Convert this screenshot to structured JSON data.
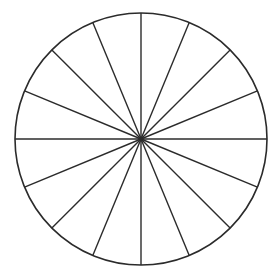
{
  "diagram": {
    "title": "",
    "shape": "circle divided into equal sectors",
    "sector_count": 16,
    "sector_angle_deg": 22.5,
    "center": [
      141,
      139
    ],
    "radius": 126,
    "colors": {
      "background": "#ffffff",
      "stroke": "#2b2b2b"
    },
    "stroke_width": 1.4,
    "spokes_angles_deg": [
      0,
      22.5,
      45,
      67.5,
      90,
      112.5,
      135,
      157.5,
      180,
      202.5,
      225,
      247.5,
      270,
      292.5,
      315,
      337.5
    ]
  }
}
